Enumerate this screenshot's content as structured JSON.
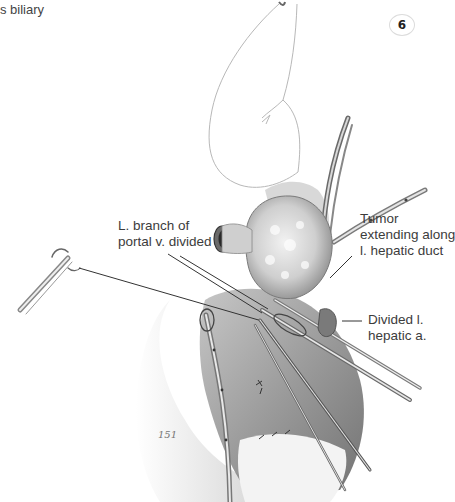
{
  "figure": {
    "caption_fragment": "s biliary",
    "figure_number": "6",
    "colors": {
      "background": "#ffffff",
      "label_text": "#3c3c3c",
      "leader_line": "#333333",
      "tissue_shading": "#8a8a8a"
    }
  },
  "labels": [
    {
      "id": "portal-branch",
      "lines": [
        "L. branch of",
        "portal v. divided"
      ]
    },
    {
      "id": "tumor",
      "lines": [
        "Tumor",
        "extending along",
        "l. hepatic duct"
      ]
    },
    {
      "id": "hepatic-artery",
      "lines": [
        "Divided l.",
        "hepatic a."
      ]
    }
  ],
  "signature": "151"
}
